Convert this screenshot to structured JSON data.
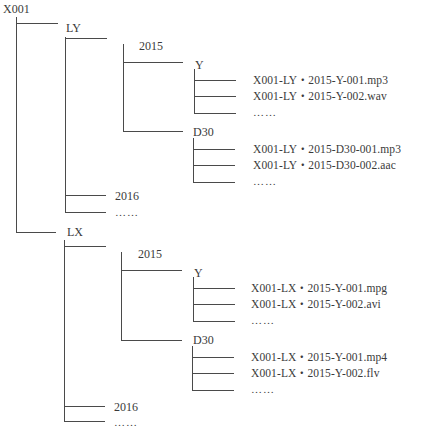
{
  "diagram": {
    "type": "tree",
    "root": "X001",
    "branches": [
      {
        "label": "LY",
        "children": [
          {
            "label": "2015",
            "children": [
              {
                "label": "Y",
                "files": [
                  "X001-LY・2015-Y-001.mp3",
                  "X001-LY・2015-Y-002.wav",
                  "……"
                ]
              },
              {
                "label": "D30",
                "files": [
                  "X001-LY・2015-D30-001.mp3",
                  "X001-LY・2015-D30-002.aac",
                  "……"
                ]
              }
            ]
          },
          {
            "label": "2016"
          },
          {
            "label": "……"
          }
        ]
      },
      {
        "label": "LX",
        "children": [
          {
            "label": "2015",
            "children": [
              {
                "label": "Y",
                "files": [
                  "X001-LX・2015-Y-001.mpg",
                  "X001-LX・2015-Y-002.avi",
                  "……"
                ]
              },
              {
                "label": "D30",
                "files": [
                  "X001-LX・2015-Y-001.mp4",
                  "X001-LX・2015-Y-002.flv",
                  "……"
                ]
              }
            ]
          },
          {
            "label": "2016"
          },
          {
            "label": "……"
          }
        ]
      }
    ]
  },
  "labels": {
    "root": "X001",
    "ly": "LY",
    "ly_2015": "2015",
    "ly_2015_y": "Y",
    "ly_2015_y_f1": "X001-LY・2015-Y-001.mp3",
    "ly_2015_y_f2": "X001-LY・2015-Y-002.wav",
    "ly_2015_y_f3": "……",
    "ly_2015_d30": "D30",
    "ly_2015_d30_f1": "X001-LY・2015-D30-001.mp3",
    "ly_2015_d30_f2": "X001-LY・2015-D30-002.aac",
    "ly_2015_d30_f3": "……",
    "ly_2016": "2016",
    "ly_more": "……",
    "lx": "LX",
    "lx_2015": "2015",
    "lx_2015_y": "Y",
    "lx_2015_y_f1": "X001-LX・2015-Y-001.mpg",
    "lx_2015_y_f2": "X001-LX・2015-Y-002.avi",
    "lx_2015_y_f3": "……",
    "lx_2015_d30": "D30",
    "lx_2015_d30_f1": "X001-LX・2015-Y-001.mp4",
    "lx_2015_d30_f2": "X001-LX・2015-Y-002.flv",
    "lx_2015_d30_f3": "……",
    "lx_2016": "2016",
    "lx_more": "……"
  },
  "colors": {
    "line": "#4a4a4a",
    "text": "#3a3a3a",
    "background": "#ffffff"
  }
}
